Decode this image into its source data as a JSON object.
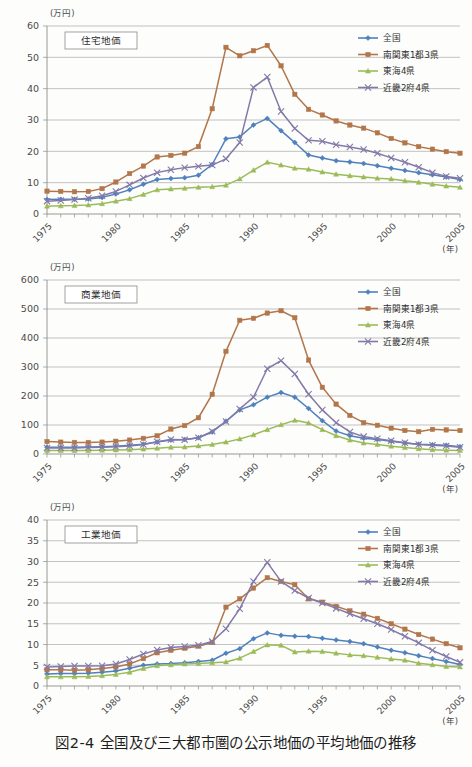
{
  "figure": {
    "caption": "図2-4 全国及び三大都市圏の公示地価の平均地価の推移",
    "y_unit_label": "(万円)",
    "x_unit_label": "(年)"
  },
  "series_meta": [
    {
      "key": "zenkoku",
      "label": "全国",
      "color": "#4f81bd",
      "marker": "diamond"
    },
    {
      "key": "minamikanto",
      "label": "南関東1都3県",
      "color": "#b2764a",
      "marker": "square"
    },
    {
      "key": "tokai",
      "label": "東海4県",
      "color": "#9bbb59",
      "marker": "triangle"
    },
    {
      "key": "kinki",
      "label": "近畿2府4県",
      "color": "#8379a8",
      "marker": "cross"
    }
  ],
  "chart_data": [
    {
      "id": "residential",
      "type": "line",
      "title": "住宅地価",
      "ylabel": "(万円)",
      "xlabel": "(年)",
      "ylim": [
        0,
        60
      ],
      "yticks": [
        0,
        10,
        20,
        30,
        40,
        50,
        60
      ],
      "xlim": [
        1975,
        2005
      ],
      "xticks": [
        1975,
        1980,
        1985,
        1990,
        1995,
        2000,
        2005
      ],
      "grid": true,
      "legend_position": "top-right",
      "x": [
        1975,
        1976,
        1977,
        1978,
        1979,
        1980,
        1981,
        1982,
        1983,
        1984,
        1985,
        1986,
        1987,
        1988,
        1989,
        1990,
        1991,
        1992,
        1993,
        1994,
        1995,
        1996,
        1997,
        1998,
        1999,
        2000,
        2001,
        2002,
        2003,
        2004,
        2005
      ],
      "series": [
        {
          "name": "全国",
          "values": [
            4.6,
            4.7,
            4.7,
            4.8,
            5.3,
            6.4,
            7.7,
            9.5,
            11.0,
            11.3,
            11.6,
            12.4,
            15.8,
            24.0,
            24.6,
            28.4,
            30.5,
            26.6,
            22.8,
            18.8,
            17.9,
            17.0,
            16.6,
            16.1,
            15.4,
            14.6,
            13.9,
            13.2,
            12.5,
            11.8,
            11.0
          ]
        },
        {
          "name": "南関東1都3県",
          "values": [
            7.3,
            7.2,
            7.1,
            7.2,
            8.1,
            10.2,
            12.9,
            15.3,
            18.2,
            18.7,
            19.4,
            21.5,
            33.6,
            53.2,
            50.5,
            52.1,
            53.8,
            47.3,
            38.2,
            33.4,
            31.6,
            29.7,
            28.4,
            27.4,
            25.9,
            24.1,
            22.7,
            21.5,
            20.7,
            19.9,
            19.4
          ]
        },
        {
          "name": "東海4県",
          "values": [
            2.5,
            2.6,
            2.7,
            2.9,
            3.3,
            4.1,
            4.9,
            6.2,
            7.7,
            8.0,
            8.2,
            8.5,
            8.7,
            9.2,
            11.2,
            14.0,
            16.5,
            15.6,
            14.6,
            14.3,
            13.4,
            12.7,
            12.2,
            11.8,
            11.4,
            11.2,
            10.6,
            10.1,
            9.5,
            8.9,
            8.5
          ]
        },
        {
          "name": "近畿2府4県",
          "values": [
            4.1,
            4.3,
            4.6,
            5.0,
            5.8,
            7.2,
            9.3,
            11.5,
            13.2,
            14.1,
            14.8,
            15.2,
            15.6,
            17.6,
            22.8,
            40.4,
            43.7,
            32.7,
            27.3,
            23.5,
            23.2,
            22.1,
            21.4,
            20.6,
            19.4,
            17.9,
            16.5,
            14.9,
            13.2,
            12.0,
            11.4
          ]
        }
      ]
    },
    {
      "id": "commercial",
      "type": "line",
      "title": "商業地価",
      "ylabel": "(万円)",
      "xlabel": "(年)",
      "ylim": [
        0,
        600
      ],
      "yticks": [
        0,
        100,
        200,
        300,
        400,
        500,
        600
      ],
      "xlim": [
        1975,
        2005
      ],
      "xticks": [
        1975,
        1980,
        1985,
        1990,
        1995,
        2000,
        2005
      ],
      "grid": true,
      "legend_position": "top-right",
      "x": [
        1975,
        1976,
        1977,
        1978,
        1979,
        1980,
        1981,
        1982,
        1983,
        1984,
        1985,
        1986,
        1987,
        1988,
        1989,
        1990,
        1991,
        1992,
        1993,
        1994,
        1995,
        1996,
        1997,
        1998,
        1999,
        2000,
        2001,
        2002,
        2003,
        2004,
        2005
      ],
      "series": [
        {
          "name": "全国",
          "values": [
            23,
            23,
            23,
            24,
            25,
            27,
            30,
            34,
            41,
            48,
            50,
            56,
            76,
            113,
            152,
            170,
            196,
            212,
            196,
            157,
            115,
            79,
            63,
            54,
            50,
            44,
            38,
            34,
            32,
            30,
            25
          ]
        },
        {
          "name": "南関東1都3県",
          "values": [
            43,
            41,
            40,
            40,
            41,
            44,
            48,
            54,
            63,
            86,
            98,
            125,
            206,
            354,
            461,
            468,
            486,
            494,
            470,
            324,
            230,
            172,
            133,
            108,
            99,
            89,
            81,
            77,
            85,
            83,
            81
          ]
        },
        {
          "name": "東海4県",
          "values": [
            12,
            12,
            12,
            12,
            13,
            14,
            15,
            17,
            20,
            23,
            24,
            28,
            33,
            41,
            52,
            66,
            84,
            101,
            116,
            107,
            84,
            63,
            48,
            38,
            33,
            27,
            22,
            18,
            15,
            13,
            12
          ]
        },
        {
          "name": "近畿2府4県",
          "values": [
            21,
            21,
            21,
            22,
            23,
            25,
            28,
            33,
            42,
            50,
            49,
            56,
            78,
            112,
            155,
            196,
            294,
            322,
            276,
            206,
            152,
            108,
            76,
            60,
            53,
            46,
            39,
            33,
            30,
            28,
            23
          ]
        }
      ]
    },
    {
      "id": "industrial",
      "type": "line",
      "title": "工業地価",
      "ylabel": "(万円)",
      "xlabel": "(年)",
      "ylim": [
        0,
        40
      ],
      "yticks": [
        0,
        5,
        10,
        15,
        20,
        25,
        30,
        35,
        40
      ],
      "xlim": [
        1975,
        2005
      ],
      "xticks": [
        1975,
        1980,
        1985,
        1990,
        1995,
        2000,
        2005
      ],
      "grid": true,
      "legend_position": "top-right",
      "x": [
        1975,
        1976,
        1977,
        1978,
        1979,
        1980,
        1981,
        1982,
        1983,
        1984,
        1985,
        1986,
        1987,
        1988,
        1989,
        1990,
        1991,
        1992,
        1993,
        1994,
        1995,
        1996,
        1997,
        1998,
        1999,
        2000,
        2001,
        2002,
        2003,
        2004,
        2005
      ],
      "series": [
        {
          "name": "全国",
          "values": [
            2.9,
            3.0,
            3.0,
            3.1,
            3.3,
            3.6,
            4.3,
            5.0,
            5.3,
            5.4,
            5.6,
            5.9,
            6.2,
            7.9,
            9.0,
            11.4,
            12.8,
            12.2,
            12.0,
            11.9,
            11.5,
            11.1,
            10.7,
            10.2,
            9.4,
            8.6,
            8.0,
            7.3,
            6.6,
            5.9,
            5.2
          ]
        },
        {
          "name": "南関東1都3県",
          "values": [
            3.9,
            3.9,
            3.8,
            3.9,
            4.2,
            4.6,
            5.3,
            6.6,
            8.0,
            8.6,
            9.1,
            9.6,
            10.5,
            19.0,
            21.0,
            23.6,
            26.1,
            25.2,
            24.4,
            21.0,
            20.2,
            19.2,
            18.1,
            17.3,
            16.3,
            15.0,
            13.7,
            12.4,
            11.3,
            10.2,
            9.2
          ]
        },
        {
          "name": "東海4県",
          "values": [
            2.2,
            2.2,
            2.2,
            2.3,
            2.5,
            2.8,
            3.3,
            4.2,
            4.9,
            5.1,
            5.3,
            5.4,
            5.6,
            5.8,
            6.7,
            8.3,
            9.9,
            9.8,
            8.2,
            8.4,
            8.3,
            7.9,
            7.5,
            7.3,
            6.9,
            6.5,
            6.2,
            5.5,
            5.1,
            4.7,
            4.6
          ]
        },
        {
          "name": "近畿2府4県",
          "values": [
            4.6,
            4.7,
            4.8,
            4.8,
            4.9,
            5.3,
            6.4,
            7.7,
            8.7,
            9.3,
            9.5,
            9.8,
            10.7,
            13.8,
            18.6,
            25.2,
            29.8,
            25.2,
            23.0,
            21.2,
            20.0,
            18.7,
            17.4,
            16.2,
            15.0,
            13.6,
            12.0,
            10.4,
            8.6,
            7.1,
            5.7
          ]
        }
      ]
    }
  ]
}
